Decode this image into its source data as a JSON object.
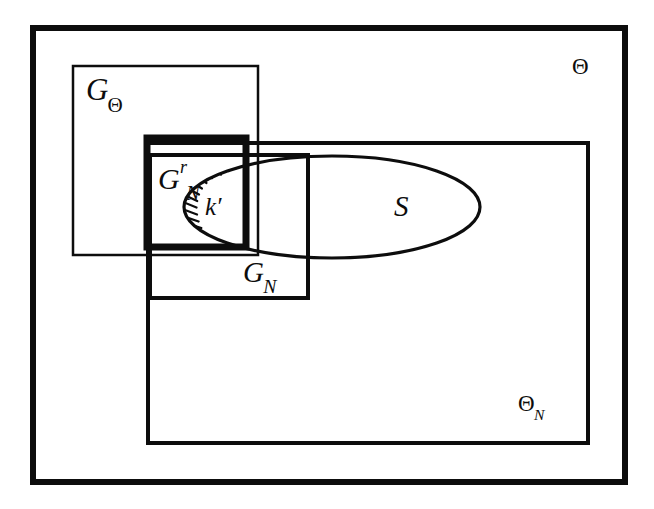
{
  "figure": {
    "kind": "set-containment-venn-diagram",
    "background_color": "#ffffff",
    "ink_color": "#0d0d0d",
    "width": 654,
    "height": 509
  },
  "labels": {
    "theta": {
      "base": "Θ",
      "sub": "",
      "sup": ""
    },
    "g_theta": {
      "base": "G",
      "sub": "Θ",
      "sup": ""
    },
    "theta_n": {
      "base": "Θ",
      "sub": "N",
      "sup": ""
    },
    "g_n_r": {
      "base": "G",
      "sub": "N",
      "sup": "r"
    },
    "g_n": {
      "base": "G",
      "sub": "N",
      "sup": ""
    },
    "s": {
      "base": "S",
      "sub": "",
      "sup": ""
    },
    "k_prime": {
      "base": "k′",
      "sub": "",
      "sup": ""
    }
  },
  "shapes": {
    "theta_box": {
      "name": "Θ",
      "x": 33,
      "y": 28,
      "w": 592,
      "h": 454,
      "stroke": "#0d0d0d",
      "stroke_width": 6
    },
    "g_theta_box": {
      "name": "GΘ",
      "x": 73,
      "y": 66,
      "w": 185,
      "h": 189,
      "stroke": "#0d0d0d",
      "stroke_width": 2.5
    },
    "theta_n_box": {
      "name": "ΘN",
      "x": 148,
      "y": 143,
      "w": 440,
      "h": 300,
      "stroke": "#0d0d0d",
      "stroke_width": 4
    },
    "g_n_box": {
      "name": "GN",
      "x": 150,
      "y": 155,
      "w": 158,
      "h": 143,
      "stroke": "#0d0d0d",
      "stroke_width": 4
    },
    "g_n_r_box": {
      "name": "GNr",
      "x": 147,
      "y": 138,
      "w": 99,
      "h": 109,
      "stroke": "#0d0d0d",
      "stroke_width": 7
    },
    "s_ellipse": {
      "name": "S",
      "cx": 332,
      "cy": 207,
      "rx": 148,
      "ry": 51,
      "stroke": "#0d0d0d",
      "stroke_width": 3.2
    },
    "k_prime_region": {
      "name": "k′",
      "description": "hatched lune: intersection of left part of ellipse S with G_N^r box",
      "hatch_stroke": "#0d0d0d",
      "hatch_stroke_width": 2.2,
      "hatch_count": 14
    }
  }
}
